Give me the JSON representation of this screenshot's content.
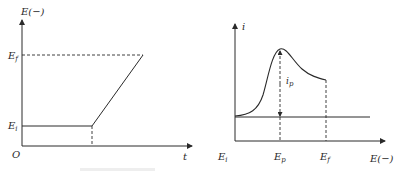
{
  "left_panel": {
    "y_axis_label": "E(−)",
    "x_axis_label": "t",
    "origin_label": "O",
    "levels": [
      {
        "name": "E",
        "sub": "f",
        "description": "final potential"
      },
      {
        "name": "E",
        "sub": "i",
        "description": "initial potential"
      }
    ],
    "description": "Potential held at E_i, then swept linearly to E_f over time"
  },
  "right_panel": {
    "y_axis_label": "i",
    "x_axis_label": "E(−)",
    "x_ticks": [
      {
        "name": "E",
        "sub": "i"
      },
      {
        "name": "E",
        "sub": "p"
      },
      {
        "name": "E",
        "sub": "f"
      }
    ],
    "peak_label": {
      "name": "i",
      "sub": "p"
    },
    "description": "Linear sweep voltammogram with peak current i_p at peak potential E_p"
  },
  "colors": {
    "line": "#2a2a2a",
    "background": "#ffffff"
  }
}
